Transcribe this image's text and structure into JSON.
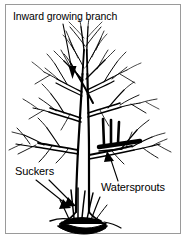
{
  "figure": {
    "background_color": "#ffffff",
    "ink_color": "#000000",
    "frame_color": "#9a9a9a"
  },
  "labels": {
    "inward_branch": {
      "text": "Inward growing branch",
      "arrow": "down",
      "points_to": "crossing branch in upper canopy"
    },
    "suckers": {
      "text": "Suckers",
      "arrow": "down-right",
      "points_to": "shoots at root crown / trunk base"
    },
    "watersprouts": {
      "text": "Watersprouts",
      "arrow": "up-left",
      "points_to": "vertical shoots on lateral scaffold branch"
    }
  }
}
